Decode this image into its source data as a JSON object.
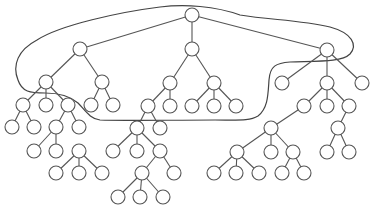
{
  "diagram": {
    "type": "tree",
    "colors": {
      "stroke": "#555555",
      "node_fill": "#ffffff",
      "background": "#ffffff",
      "curve": "#444444"
    },
    "node_radius": 7,
    "nodes": [
      {
        "id": "r",
        "x": 192,
        "y": 15
      },
      {
        "id": "a",
        "x": 80,
        "y": 49
      },
      {
        "id": "b",
        "x": 192,
        "y": 49
      },
      {
        "id": "c",
        "x": 327,
        "y": 50
      },
      {
        "id": "a1",
        "x": 46,
        "y": 82
      },
      {
        "id": "a2",
        "x": 102,
        "y": 82
      },
      {
        "id": "a11",
        "x": 23,
        "y": 105
      },
      {
        "id": "a12",
        "x": 46,
        "y": 105
      },
      {
        "id": "a13",
        "x": 68,
        "y": 105
      },
      {
        "id": "a21",
        "x": 91,
        "y": 105
      },
      {
        "id": "a22",
        "x": 113,
        "y": 105
      },
      {
        "id": "a111",
        "x": 12,
        "y": 127
      },
      {
        "id": "a112",
        "x": 34,
        "y": 127
      },
      {
        "id": "a131",
        "x": 56,
        "y": 127
      },
      {
        "id": "a132",
        "x": 79,
        "y": 127
      },
      {
        "id": "a1311",
        "x": 34,
        "y": 151
      },
      {
        "id": "a1312",
        "x": 56,
        "y": 151
      },
      {
        "id": "x1",
        "x": 79,
        "y": 151
      },
      {
        "id": "x11",
        "x": 56,
        "y": 173
      },
      {
        "id": "x12",
        "x": 79,
        "y": 173
      },
      {
        "id": "x13",
        "x": 102,
        "y": 173
      },
      {
        "id": "b1",
        "x": 170,
        "y": 83
      },
      {
        "id": "b2",
        "x": 214,
        "y": 83
      },
      {
        "id": "b11",
        "x": 148,
        "y": 106
      },
      {
        "id": "b12",
        "x": 170,
        "y": 106
      },
      {
        "id": "b21",
        "x": 192,
        "y": 106
      },
      {
        "id": "b22",
        "x": 214,
        "y": 106
      },
      {
        "id": "b23",
        "x": 236,
        "y": 106
      },
      {
        "id": "b111",
        "x": 137,
        "y": 128
      },
      {
        "id": "b112",
        "x": 160,
        "y": 128
      },
      {
        "id": "b1111",
        "x": 113,
        "y": 151
      },
      {
        "id": "b1112",
        "x": 137,
        "y": 151
      },
      {
        "id": "b1113",
        "x": 160,
        "y": 151
      },
      {
        "id": "b11131",
        "x": 142,
        "y": 173
      },
      {
        "id": "b11132",
        "x": 174,
        "y": 173
      },
      {
        "id": "b111311",
        "x": 118,
        "y": 197
      },
      {
        "id": "b111312",
        "x": 140,
        "y": 197
      },
      {
        "id": "b111313",
        "x": 163,
        "y": 197
      },
      {
        "id": "c1",
        "x": 282,
        "y": 83
      },
      {
        "id": "c2",
        "x": 327,
        "y": 83
      },
      {
        "id": "c3",
        "x": 362,
        "y": 83
      },
      {
        "id": "c21",
        "x": 304,
        "y": 106
      },
      {
        "id": "c22",
        "x": 327,
        "y": 106
      },
      {
        "id": "c23",
        "x": 349,
        "y": 106
      },
      {
        "id": "c211",
        "x": 271,
        "y": 128
      },
      {
        "id": "c231",
        "x": 338,
        "y": 128
      },
      {
        "id": "c2111",
        "x": 237,
        "y": 152
      },
      {
        "id": "c2112",
        "x": 271,
        "y": 152
      },
      {
        "id": "c2113",
        "x": 293,
        "y": 152
      },
      {
        "id": "c21111",
        "x": 214,
        "y": 173
      },
      {
        "id": "c21112",
        "x": 236,
        "y": 173
      },
      {
        "id": "c21113",
        "x": 259,
        "y": 173
      },
      {
        "id": "c21131",
        "x": 282,
        "y": 173
      },
      {
        "id": "c21132",
        "x": 304,
        "y": 173
      },
      {
        "id": "c2311",
        "x": 327,
        "y": 152
      },
      {
        "id": "c2312",
        "x": 349,
        "y": 152
      }
    ],
    "edges": [
      [
        "r",
        "a"
      ],
      [
        "r",
        "b"
      ],
      [
        "r",
        "c"
      ],
      [
        "a",
        "a1"
      ],
      [
        "a",
        "a2"
      ],
      [
        "a1",
        "a11"
      ],
      [
        "a1",
        "a12"
      ],
      [
        "a1",
        "a13"
      ],
      [
        "a2",
        "a21"
      ],
      [
        "a2",
        "a22"
      ],
      [
        "a11",
        "a111"
      ],
      [
        "a11",
        "a112"
      ],
      [
        "a13",
        "a131"
      ],
      [
        "a13",
        "a132"
      ],
      [
        "a131",
        "a1311"
      ],
      [
        "a131",
        "a1312"
      ],
      [
        "x1",
        "x11"
      ],
      [
        "x1",
        "x12"
      ],
      [
        "x1",
        "x13"
      ],
      [
        "b",
        "b1"
      ],
      [
        "b",
        "b2"
      ],
      [
        "b1",
        "b11"
      ],
      [
        "b1",
        "b12"
      ],
      [
        "b2",
        "b21"
      ],
      [
        "b2",
        "b22"
      ],
      [
        "b2",
        "b23"
      ],
      [
        "b11",
        "b111"
      ],
      [
        "b11",
        "b112"
      ],
      [
        "b111",
        "b1111"
      ],
      [
        "b111",
        "b1112"
      ],
      [
        "b111",
        "b1113"
      ],
      [
        "b1113",
        "b11131"
      ],
      [
        "b1113",
        "b11132"
      ],
      [
        "b11131",
        "b111311"
      ],
      [
        "b11131",
        "b111312"
      ],
      [
        "b11131",
        "b111313"
      ],
      [
        "c",
        "c1"
      ],
      [
        "c",
        "c2"
      ],
      [
        "c",
        "c3"
      ],
      [
        "c2",
        "c21"
      ],
      [
        "c2",
        "c22"
      ],
      [
        "c2",
        "c23"
      ],
      [
        "c21",
        "c211"
      ],
      [
        "c211",
        "c2111"
      ],
      [
        "c211",
        "c2112"
      ],
      [
        "c211",
        "c2113"
      ],
      [
        "c2111",
        "c21111"
      ],
      [
        "c2111",
        "c21112"
      ],
      [
        "c2111",
        "c21113"
      ],
      [
        "c2113",
        "c21131"
      ],
      [
        "c2113",
        "c21132"
      ],
      [
        "c23",
        "c231"
      ],
      [
        "c231",
        "c2311"
      ],
      [
        "c231",
        "c2312"
      ]
    ],
    "enclosing_curve": "M 37 40 C 60 25, 120 12, 160 7 C 185 4, 215 6, 240 15 C 270 20, 300 20, 330 27 C 352 33, 358 45, 350 54 C 342 62, 320 61, 290 62 C 276 63, 270 66, 269 80 C 268 95, 268 108, 258 116 C 250 121, 240 120, 215 120 C 170 120, 120 121, 100 120 C 90 119, 85 110, 78 103 C 70 96, 60 93, 45 93 C 30 93, 22 92, 18 80 C 12 65, 18 50, 37 40 Z"
  }
}
